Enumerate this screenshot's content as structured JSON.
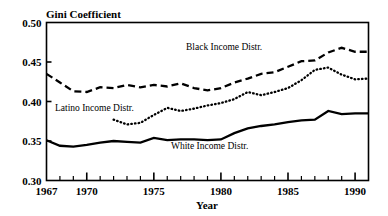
{
  "chart_data": {
    "type": "line",
    "title": "Gini Coefficient",
    "xlabel": "Year",
    "ylabel": "Gini Coefficient",
    "xlim": [
      1967,
      1991
    ],
    "ylim": [
      0.3,
      0.5
    ],
    "ytick_labels": [
      "0.50",
      "0.45",
      "0.40",
      "0.35",
      "0.30"
    ],
    "ytick_values": [
      0.5,
      0.45,
      0.4,
      0.35,
      0.3
    ],
    "xtick_values": [
      1967,
      1968,
      1969,
      1970,
      1971,
      1972,
      1973,
      1974,
      1975,
      1976,
      1977,
      1978,
      1979,
      1980,
      1981,
      1982,
      1983,
      1984,
      1985,
      1986,
      1987,
      1988,
      1989,
      1990,
      1991
    ],
    "xtick_labeled": [
      1967,
      1970,
      1975,
      1980,
      1985,
      1990
    ],
    "xtick_labels": [
      "1967",
      "1970",
      "1975",
      "1980",
      "1985",
      "1990"
    ],
    "grid": false,
    "legend_position": "inline-annotations",
    "series": [
      {
        "name": "Black Income Distr.",
        "style": "dashed",
        "label_text": "Black Income Distr.",
        "x": [
          1967,
          1968,
          1969,
          1970,
          1971,
          1972,
          1973,
          1974,
          1975,
          1976,
          1977,
          1978,
          1979,
          1980,
          1981,
          1982,
          1983,
          1984,
          1985,
          1986,
          1987,
          1988,
          1989,
          1990,
          1991
        ],
        "values": [
          0.435,
          0.424,
          0.413,
          0.412,
          0.418,
          0.417,
          0.421,
          0.418,
          0.421,
          0.419,
          0.423,
          0.417,
          0.414,
          0.417,
          0.424,
          0.429,
          0.435,
          0.437,
          0.444,
          0.451,
          0.452,
          0.462,
          0.468,
          0.463,
          0.463
        ]
      },
      {
        "name": "Latino Income Distr.",
        "style": "dotted",
        "label_text": "Latino Income Distr.",
        "x": [
          1972,
          1973,
          1974,
          1975,
          1976,
          1977,
          1978,
          1979,
          1980,
          1981,
          1982,
          1983,
          1984,
          1985,
          1986,
          1987,
          1988,
          1989,
          1990,
          1991
        ],
        "values": [
          0.377,
          0.371,
          0.373,
          0.383,
          0.392,
          0.388,
          0.391,
          0.395,
          0.398,
          0.403,
          0.412,
          0.408,
          0.412,
          0.417,
          0.427,
          0.44,
          0.443,
          0.434,
          0.428,
          0.429
        ]
      },
      {
        "name": "White Income Distr.",
        "style": "solid",
        "label_text": "White Income Distr.",
        "x": [
          1967,
          1968,
          1969,
          1970,
          1971,
          1972,
          1973,
          1974,
          1975,
          1976,
          1977,
          1978,
          1979,
          1980,
          1981,
          1982,
          1983,
          1984,
          1985,
          1986,
          1987,
          1988,
          1989,
          1990,
          1991
        ],
        "values": [
          0.351,
          0.344,
          0.343,
          0.345,
          0.348,
          0.35,
          0.349,
          0.348,
          0.354,
          0.351,
          0.352,
          0.352,
          0.351,
          0.352,
          0.36,
          0.366,
          0.369,
          0.371,
          0.374,
          0.376,
          0.377,
          0.388,
          0.384,
          0.385,
          0.385
        ]
      }
    ],
    "annotations": [
      {
        "text": "Black Income Distr.",
        "x_px": 186,
        "y_px": 50
      },
      {
        "text": "Latino Income Distr.",
        "x_px": 55,
        "y_px": 111
      },
      {
        "text": "White Income Distr.",
        "x_px": 171,
        "y_px": 149
      }
    ]
  },
  "colors": {
    "ink": "#000000",
    "background": "#ffffff"
  }
}
